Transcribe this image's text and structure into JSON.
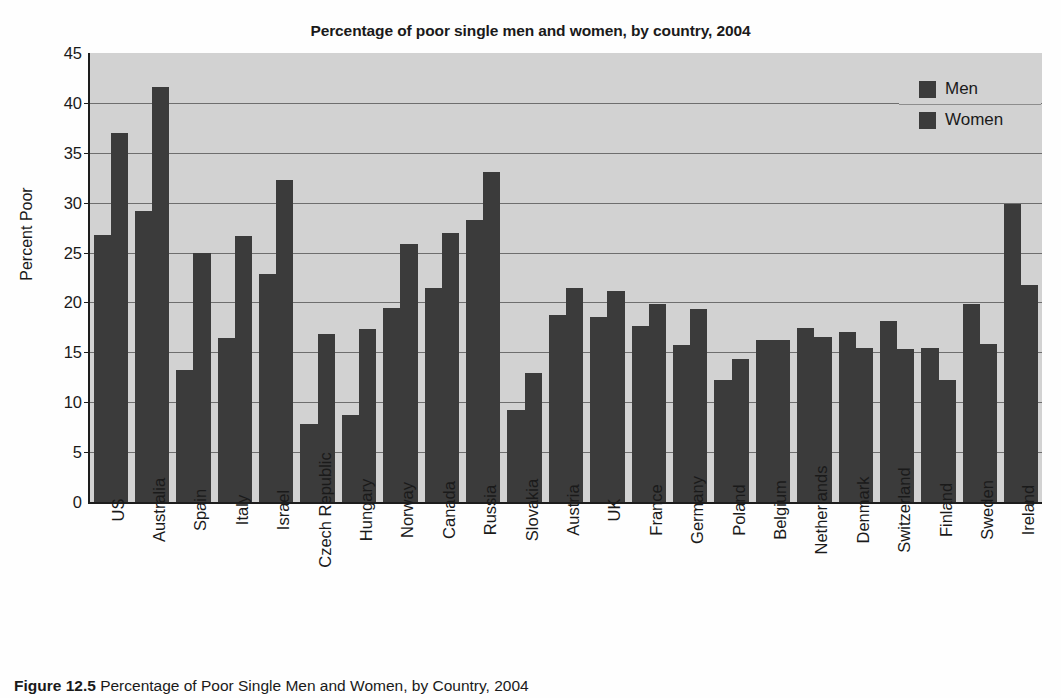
{
  "chart_data": {
    "type": "bar",
    "title": "Percentage of poor single men and women, by country, 2004",
    "xlabel": "",
    "ylabel": "Percent Poor",
    "ylim": [
      0,
      45
    ],
    "ytick_step": 5,
    "yticks": [
      45,
      40,
      35,
      30,
      25,
      20,
      15,
      10,
      5,
      0
    ],
    "grid": true,
    "legend_position": "top-right",
    "categories": [
      "US",
      "Australia",
      "Spain",
      "Italy",
      "Israel",
      "Czech Republic",
      "Hungary",
      "Norway",
      "Canada",
      "Russia",
      "Slovakia",
      "Austria",
      "UK",
      "France",
      "Germany",
      "Poland",
      "Belgium",
      "Netherlands",
      "Denmark",
      "Switzerland",
      "Finland",
      "Sweden",
      "Ireland"
    ],
    "series": [
      {
        "name": "Men",
        "values": [
          26.8,
          29.2,
          13.2,
          16.4,
          22.9,
          7.8,
          8.7,
          19.4,
          21.4,
          28.3,
          9.2,
          18.7,
          18.5,
          17.6,
          15.7,
          12.2,
          16.2,
          17.4,
          17.0,
          18.1,
          15.4,
          19.8,
          29.9
        ]
      },
      {
        "name": "Women",
        "values": [
          37.0,
          41.6,
          25.0,
          26.7,
          32.3,
          16.8,
          17.3,
          25.9,
          27.0,
          33.1,
          12.9,
          21.4,
          21.1,
          19.8,
          19.3,
          14.3,
          16.2,
          16.5,
          15.4,
          15.3,
          12.2,
          15.8,
          21.8
        ]
      }
    ],
    "colors": {
      "bar": "#3b3b3b",
      "plot_background": "#d2d2d2",
      "gridline": "#6e6e6e",
      "axis": "#1d1d1d",
      "text": "#1a1a1a"
    }
  },
  "legend": {
    "items": [
      {
        "label": "Men",
        "swatch_name": "legend-swatch-men"
      },
      {
        "label": "Women",
        "swatch_name": "legend-swatch-women"
      }
    ]
  },
  "caption": {
    "number": "Figure 12.5",
    "text": "Percentage of Poor Single Men and Women, by Country, 2004"
  }
}
